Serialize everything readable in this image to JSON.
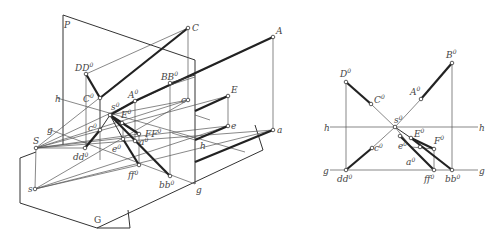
{
  "figure": {
    "left": {
      "labels": {
        "P": "P",
        "C": "C",
        "A": "A",
        "DD0": "DD",
        "BB0": "BB",
        "h": "h",
        "C0": "C",
        "A0": "A",
        "c": "c",
        "E": "E",
        "s0": "s",
        "E0": "E",
        "FF0": "FF",
        "g": "g",
        "c0": "c",
        "a0": "a",
        "S": "S",
        "e0": "e",
        "dd0": "dd",
        "e": "e",
        "a": "a",
        "h2": "h",
        "s": "s",
        "ff0": "ff",
        "bb0": "bb",
        "g2": "g",
        "G": "G"
      }
    },
    "right": {
      "labels": {
        "D0": "D",
        "B0": "B",
        "C0": "C",
        "A0": "A",
        "h_left": "h",
        "h_right": "h",
        "s0": "s",
        "E0": "E",
        "F0": "F",
        "c0": "c",
        "e0": "e",
        "a0": "a",
        "g_left": "g",
        "g_right": "g",
        "dd0": "dd",
        "ff0": "ff",
        "bb0": "bb"
      }
    },
    "superscript": "0"
  }
}
